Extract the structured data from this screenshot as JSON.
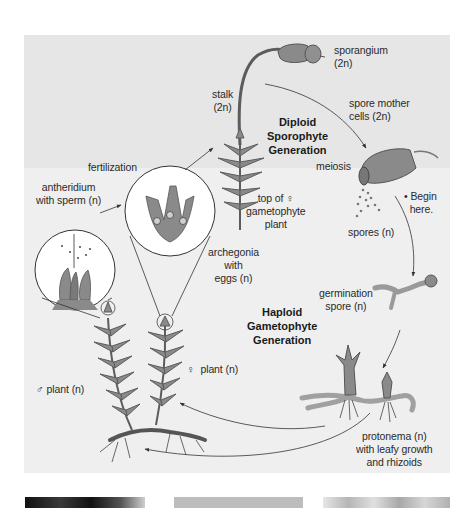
{
  "diagram": {
    "title_regions": {
      "diploid": {
        "label": "Diploid\nSporophyte\nGeneration"
      },
      "haploid": {
        "label": "Haploid\nGametophyte\nGeneration"
      }
    },
    "labels": {
      "sporangium": "sporangium\n(2n)",
      "stalk": "stalk\n(2n)",
      "spore_mother_cells": "spore mother\ncells (2n)",
      "fertilization": "fertilization",
      "antheridium": "antheridium\nwith sperm (n)",
      "meiosis": "meiosis",
      "begin_here": "• Begin\n  here.",
      "top_of_female": "top of ♀\ngametophyte\nplant",
      "spores": "spores (n)",
      "archegonia": "archegonia\nwith\neggs (n)",
      "germination_spore": "germination\nspore (n)",
      "female_plant": "♀  plant (n)",
      "male_plant": "♂ plant (n)",
      "protonema": "protonema (n)\nwith leafy growth\nand rhizoids"
    },
    "colors": {
      "panel_bg": "#efefef",
      "diploid_band_bg": "#e6e6e6",
      "plant_fill": "#8a8a8a",
      "plant_stroke": "#5c5c5c",
      "arrow": "#333333"
    }
  },
  "photo_strip": {
    "thumbnails": [
      {
        "name": "moss-photo-dark",
        "color": "#1e1e1e"
      },
      {
        "name": "moss-photo-gray",
        "color": "#bdbdbd"
      },
      {
        "name": "moss-photo-light",
        "color": "#dcdcdc"
      }
    ]
  }
}
